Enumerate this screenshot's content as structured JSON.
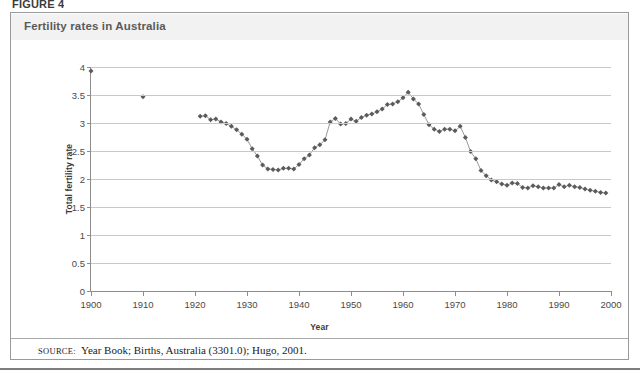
{
  "figure": {
    "label": "FIGURE 4",
    "title": "Fertility rates in Australia",
    "source_prefix": "SOURCE:",
    "source_text": "Year Book; Births, Australia (3301.0); Hugo, 2001.",
    "frame_color": "#9a9a9a",
    "title_band_color": "#f2f2f2",
    "title_color": "#5a5a5a"
  },
  "chart_data": {
    "type": "line",
    "title": "Fertility rates in Australia",
    "xlabel": "Year",
    "ylabel": "Total fertility rate",
    "xlim": [
      1900,
      2000
    ],
    "ylim": [
      0,
      4
    ],
    "xticks": [
      1900,
      1910,
      1920,
      1930,
      1940,
      1950,
      1960,
      1970,
      1980,
      1990,
      2000
    ],
    "yticks": [
      0,
      0.5,
      1,
      1.5,
      2,
      2.5,
      3,
      3.5,
      4
    ],
    "grid": "horizontal",
    "legend": "none",
    "marker": "diamond",
    "marker_color": "#5b5b5b",
    "line_color": "#8c8c8c",
    "series": [
      {
        "name": "Total fertility rate",
        "points": [
          [
            1900,
            3.93
          ],
          [
            1910,
            3.47
          ]
        ],
        "connected": false
      },
      {
        "name": "Total fertility rate (annual)",
        "connected": true,
        "points": [
          [
            1921,
            3.12
          ],
          [
            1922,
            3.13
          ],
          [
            1923,
            3.06
          ],
          [
            1924,
            3.07
          ],
          [
            1925,
            3.02
          ],
          [
            1926,
            2.99
          ],
          [
            1927,
            2.94
          ],
          [
            1928,
            2.88
          ],
          [
            1929,
            2.8
          ],
          [
            1930,
            2.71
          ],
          [
            1931,
            2.54
          ],
          [
            1932,
            2.41
          ],
          [
            1933,
            2.25
          ],
          [
            1934,
            2.18
          ],
          [
            1935,
            2.17
          ],
          [
            1936,
            2.16
          ],
          [
            1937,
            2.19
          ],
          [
            1938,
            2.19
          ],
          [
            1939,
            2.18
          ],
          [
            1940,
            2.26
          ],
          [
            1941,
            2.36
          ],
          [
            1942,
            2.43
          ],
          [
            1943,
            2.56
          ],
          [
            1944,
            2.61
          ],
          [
            1945,
            2.7
          ],
          [
            1946,
            3.02
          ],
          [
            1947,
            3.08
          ],
          [
            1948,
            2.98
          ],
          [
            1949,
            2.99
          ],
          [
            1950,
            3.07
          ],
          [
            1951,
            3.03
          ],
          [
            1952,
            3.1
          ],
          [
            1953,
            3.14
          ],
          [
            1954,
            3.16
          ],
          [
            1955,
            3.2
          ],
          [
            1956,
            3.25
          ],
          [
            1957,
            3.33
          ],
          [
            1958,
            3.34
          ],
          [
            1959,
            3.38
          ],
          [
            1960,
            3.45
          ],
          [
            1961,
            3.55
          ],
          [
            1962,
            3.43
          ],
          [
            1963,
            3.34
          ],
          [
            1964,
            3.15
          ],
          [
            1965,
            2.97
          ],
          [
            1966,
            2.89
          ],
          [
            1967,
            2.85
          ],
          [
            1968,
            2.89
          ],
          [
            1969,
            2.89
          ],
          [
            1970,
            2.86
          ],
          [
            1971,
            2.94
          ],
          [
            1972,
            2.74
          ],
          [
            1973,
            2.49
          ],
          [
            1974,
            2.36
          ],
          [
            1975,
            2.15
          ],
          [
            1976,
            2.06
          ],
          [
            1977,
            1.98
          ],
          [
            1978,
            1.95
          ],
          [
            1979,
            1.91
          ],
          [
            1980,
            1.89
          ],
          [
            1981,
            1.93
          ],
          [
            1982,
            1.92
          ],
          [
            1983,
            1.85
          ],
          [
            1984,
            1.84
          ],
          [
            1985,
            1.88
          ],
          [
            1986,
            1.86
          ],
          [
            1987,
            1.84
          ],
          [
            1988,
            1.84
          ],
          [
            1989,
            1.84
          ],
          [
            1990,
            1.9
          ],
          [
            1991,
            1.86
          ],
          [
            1992,
            1.89
          ],
          [
            1993,
            1.86
          ],
          [
            1994,
            1.85
          ],
          [
            1995,
            1.82
          ],
          [
            1996,
            1.8
          ],
          [
            1997,
            1.78
          ],
          [
            1998,
            1.76
          ],
          [
            1999,
            1.75
          ]
        ]
      }
    ]
  }
}
